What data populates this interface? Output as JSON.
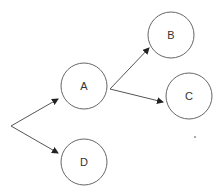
{
  "diagram": {
    "type": "directed-graph",
    "colors": {
      "stroke": "#555555",
      "text": "#333333",
      "background": "#ffffff"
    },
    "nodes": [
      {
        "id": "A",
        "label": "A",
        "cx": 84,
        "cy": 86,
        "r": 23
      },
      {
        "id": "B",
        "label": "B",
        "cx": 171,
        "cy": 35,
        "r": 23
      },
      {
        "id": "C",
        "label": "C",
        "cx": 189,
        "cy": 96,
        "r": 23
      },
      {
        "id": "D",
        "label": "D",
        "cx": 84,
        "cy": 162,
        "r": 23
      }
    ],
    "edges": [
      {
        "from": "origin",
        "to": "A",
        "x1": 11,
        "y1": 126,
        "x2": 58,
        "y2": 99
      },
      {
        "from": "origin",
        "to": "D",
        "x1": 11,
        "y1": 126,
        "x2": 58,
        "y2": 153
      },
      {
        "from": "A",
        "to": "B",
        "x1": 110,
        "y1": 89,
        "x2": 149,
        "y2": 48
      },
      {
        "from": "A",
        "to": "C",
        "x1": 110,
        "y1": 89,
        "x2": 163,
        "y2": 102
      }
    ]
  }
}
